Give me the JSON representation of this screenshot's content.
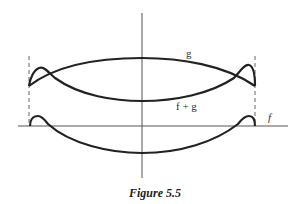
{
  "figure": {
    "caption": "Figure 5.5",
    "labels": {
      "g": "g",
      "f_plus_g": "f + g",
      "f": "f"
    },
    "colors": {
      "curve": "#222222",
      "axis": "#555555",
      "dashed": "#666666"
    }
  }
}
